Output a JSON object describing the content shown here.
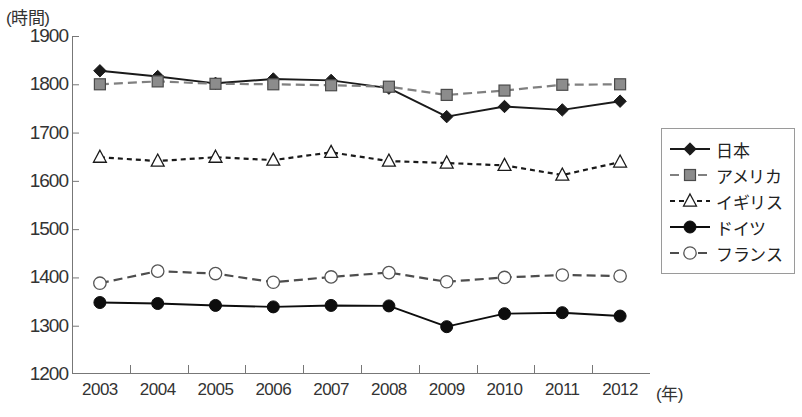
{
  "chart_data": {
    "type": "line",
    "title": "",
    "subtitle": "",
    "xlabel": "(年)",
    "ylabel": "(時間)",
    "ylim": [
      1200,
      1900
    ],
    "ytick_step": 100,
    "yticks": [
      1900,
      1800,
      1700,
      1600,
      1500,
      1400,
      1300,
      1200
    ],
    "grid": false,
    "legend_position": "right",
    "categories": [
      "2003",
      "2004",
      "2005",
      "2006",
      "2007",
      "2008",
      "2009",
      "2010",
      "2011",
      "2012"
    ],
    "x": [
      2003,
      2004,
      2005,
      2006,
      2007,
      2008,
      2009,
      2010,
      2011,
      2012
    ],
    "series": [
      {
        "name": "日本",
        "marker": "filled-diamond",
        "line": "solid",
        "color": "#1a1a1a",
        "values": [
          1828,
          1816,
          1802,
          1811,
          1808,
          1792,
          1733,
          1754,
          1747,
          1765
        ]
      },
      {
        "name": "アメリカ",
        "marker": "filled-square",
        "line": "dashed",
        "color": "#808080",
        "values": [
          1800,
          1806,
          1801,
          1800,
          1798,
          1795,
          1778,
          1787,
          1799,
          1800
        ]
      },
      {
        "name": "イギリス",
        "marker": "open-triangle",
        "line": "dotted",
        "color": "#1a1a1a",
        "values": [
          1649,
          1641,
          1649,
          1643,
          1659,
          1641,
          1637,
          1632,
          1612,
          1639
        ]
      },
      {
        "name": "ドイツ",
        "marker": "filled-circle",
        "line": "solid",
        "color": "#0d0d0d",
        "values": [
          1348,
          1346,
          1342,
          1339,
          1342,
          1341,
          1298,
          1325,
          1327,
          1320
        ]
      },
      {
        "name": "フランス",
        "marker": "open-circle",
        "line": "dashed",
        "color": "#4d4d4d",
        "values": [
          1388,
          1413,
          1408,
          1390,
          1401,
          1410,
          1391,
          1400,
          1405,
          1403
        ]
      }
    ]
  },
  "axes": {
    "y_unit": "(時間)",
    "x_unit": "(年)"
  },
  "legend": {
    "items": [
      {
        "label": "日本"
      },
      {
        "label": "アメリカ"
      },
      {
        "label": "イギリス"
      },
      {
        "label": "ドイツ"
      },
      {
        "label": "フランス"
      }
    ]
  }
}
